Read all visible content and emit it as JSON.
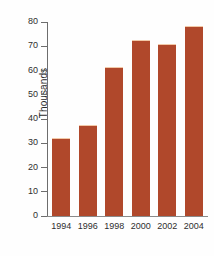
{
  "chart_data": {
    "type": "bar",
    "title": "",
    "xlabel": "",
    "ylabel": "Thousands",
    "categories": [
      "1994",
      "1996",
      "1998",
      "2000",
      "2002",
      "2004"
    ],
    "values": [
      32,
      37.5,
      61.5,
      72.5,
      71,
      78.5
    ],
    "ylim": [
      0,
      80
    ],
    "ytick_labels": [
      "80",
      "70",
      "60",
      "50",
      "40",
      "30",
      "20",
      "10",
      "0"
    ],
    "ytick_values": [
      80,
      70,
      60,
      50,
      40,
      30,
      20,
      10,
      0
    ],
    "ytick_step": 10,
    "grid": false,
    "legend": null,
    "bar_color": "#b0482b",
    "axis_color": "#6d6d6d",
    "text_color": "#2e2e2e",
    "background_color": "#ffffff"
  }
}
